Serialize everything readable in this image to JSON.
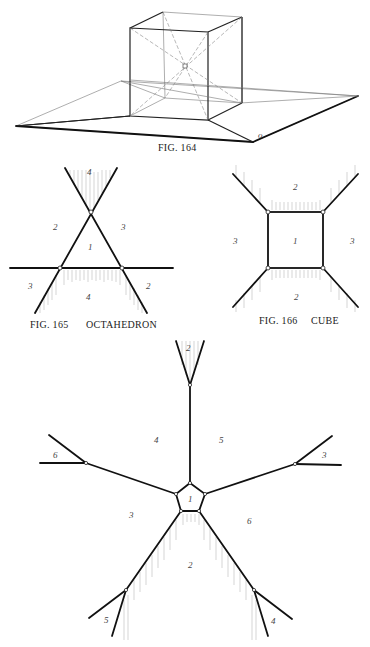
{
  "fig164": {
    "caption": "FIG. 164",
    "corner_mark": "o"
  },
  "fig165": {
    "caption_num": "FIG. 165",
    "caption_name": "OCTAHEDRON",
    "labels": {
      "top": "4",
      "left": "2",
      "right": "3",
      "center": "1",
      "bottom_left": "3",
      "bottom": "4",
      "bottom_right": "2"
    }
  },
  "fig166": {
    "caption_num": "FIG. 166",
    "caption_name": "CUBE",
    "labels": {
      "top": "2",
      "left": "3",
      "center": "1",
      "right": "3",
      "bottom": "2"
    }
  },
  "fig167": {
    "labels": {
      "top_v": "2",
      "upper_left": "4",
      "upper_right": "5",
      "far_left": "6",
      "far_right": "3",
      "center": "1",
      "mid_left": "3",
      "mid_right": "6",
      "bottom": "2",
      "bottom_left": "5",
      "bottom_right": "4"
    }
  }
}
